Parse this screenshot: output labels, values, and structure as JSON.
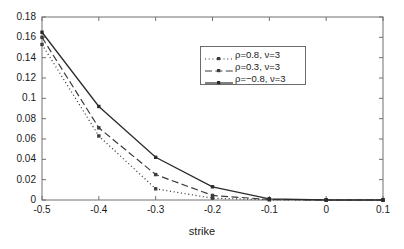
{
  "chart_data": {
    "type": "line",
    "title": "",
    "xlabel": "strike",
    "ylabel": "",
    "xlim": [
      -0.5,
      0.1
    ],
    "ylim": [
      0,
      0.18
    ],
    "grid": false,
    "legend_position": "upper center",
    "x": [
      -0.5,
      -0.4,
      -0.3,
      -0.2,
      -0.1,
      0,
      0.1
    ],
    "xticks": [
      "-0.5",
      "-0.4",
      "-0.3",
      "-0.2",
      "-0.1",
      "0",
      "0.1"
    ],
    "xtick_values": [
      -0.5,
      -0.4,
      -0.3,
      -0.2,
      -0.1,
      0,
      0.1
    ],
    "yticks": [
      "0",
      "0.02",
      "0.04",
      "0.06",
      "0.08",
      "0.1",
      "0.12",
      "0.14",
      "0.16",
      "0.18"
    ],
    "ytick_values": [
      0,
      0.02,
      0.04,
      0.06,
      0.08,
      0.1,
      0.12,
      0.14,
      0.16,
      0.18
    ],
    "series": [
      {
        "name": "ρ=0.8, ν=3",
        "style": "dotted",
        "marker": "square",
        "color": "#3c3c3c",
        "values": [
          0.153,
          0.063,
          0.011,
          0.0018,
          0.0002,
          0,
          0
        ]
      },
      {
        "name": "ρ=0.3, ν=3",
        "style": "dashed",
        "marker": "square",
        "color": "#3c3c3c",
        "values": [
          0.16,
          0.071,
          0.025,
          0.0045,
          0.0005,
          0,
          0
        ]
      },
      {
        "name": "ρ=−0.8, ν=3",
        "style": "solid",
        "marker": "square",
        "color": "#2b2b2b",
        "values": [
          0.165,
          0.092,
          0.042,
          0.013,
          0.0012,
          0,
          0
        ]
      }
    ]
  },
  "axes": {
    "frame_color": "#707070",
    "text_color": "#1a1a1a"
  }
}
